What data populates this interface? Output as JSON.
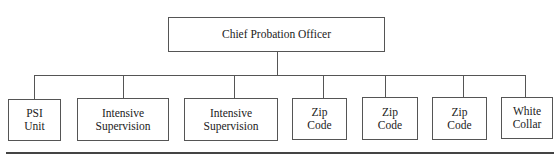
{
  "chart": {
    "root": {
      "label": "Chief Probation Officer"
    },
    "children": [
      {
        "line1": "PSI",
        "line2": "Unit"
      },
      {
        "line1": "Intensive",
        "line2": "Supervision"
      },
      {
        "line1": "Intensive",
        "line2": "Supervision"
      },
      {
        "line1": "Zip",
        "line2": "Code"
      },
      {
        "line1": "Zip",
        "line2": "Code"
      },
      {
        "line1": "Zip",
        "line2": "Code"
      },
      {
        "line1": "White",
        "line2": "Collar"
      }
    ]
  }
}
